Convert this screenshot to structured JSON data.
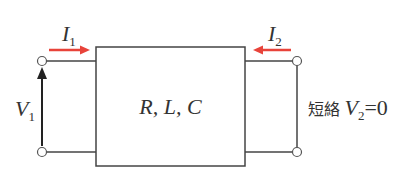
{
  "diagram": {
    "title_partial": "",
    "box_label": "R, L, C",
    "input_current": {
      "symbol": "I",
      "sub": "1",
      "color": "#e8433a"
    },
    "output_current": {
      "symbol": "I",
      "sub": "2",
      "color": "#e8433a"
    },
    "input_voltage": {
      "symbol": "V",
      "sub": "1"
    },
    "short_label": "短絡",
    "output_voltage": {
      "symbol": "V",
      "sub": "2",
      "equals": "=0"
    },
    "colors": {
      "line": "#444444",
      "arrow_current": "#e8433a",
      "arrow_voltage": "#222222"
    }
  }
}
